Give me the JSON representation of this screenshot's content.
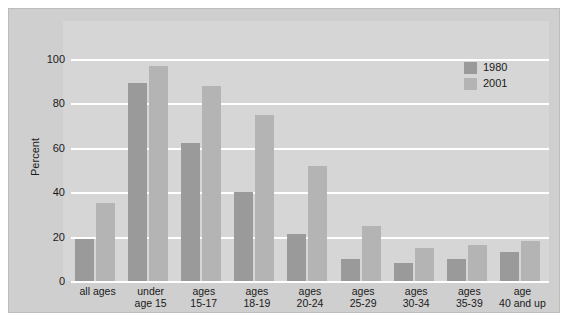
{
  "chart_data": {
    "type": "bar",
    "title": "",
    "xlabel": "",
    "ylabel": "Percent",
    "ylim": [
      0,
      100
    ],
    "yticks": [
      0,
      20,
      40,
      60,
      80,
      100
    ],
    "ytick_labels": [
      "0",
      "20",
      "40",
      "60",
      "80",
      "100"
    ],
    "grid": true,
    "legend_position": "top-right",
    "categories": [
      "all ages",
      "under age 15",
      "ages 15-17",
      "ages 18-19",
      "ages 20-24",
      "ages 25-29",
      "ages 30-34",
      "ages 35-39",
      "age 40 and up"
    ],
    "category_lines": [
      [
        "all ages",
        ""
      ],
      [
        "under",
        "age 15"
      ],
      [
        "ages",
        "15-17"
      ],
      [
        "ages",
        "18-19"
      ],
      [
        "ages",
        "20-24"
      ],
      [
        "ages",
        "25-29"
      ],
      [
        "ages",
        "30-34"
      ],
      [
        "ages",
        "35-39"
      ],
      [
        "age",
        "40 and up"
      ]
    ],
    "series": [
      {
        "name": "1980",
        "color": "#9a9a9a",
        "values": [
          19,
          89,
          62,
          40,
          21,
          10,
          8,
          10,
          13
        ]
      },
      {
        "name": "2001",
        "color": "#b4b4b4",
        "values": [
          35,
          97,
          88,
          75,
          52,
          25,
          15,
          16,
          18
        ]
      }
    ]
  },
  "legend": {
    "entries": [
      {
        "label": "1980"
      },
      {
        "label": "2001"
      }
    ]
  },
  "colors": {
    "series_1980": "#9a9a9a",
    "series_2001": "#b4b4b4",
    "frame_background": "#cfcfcf",
    "plot_background": "#d6d6d6",
    "gridline": "#ffffff",
    "page_background": "#ffffff",
    "text": "#1a1a1a"
  }
}
